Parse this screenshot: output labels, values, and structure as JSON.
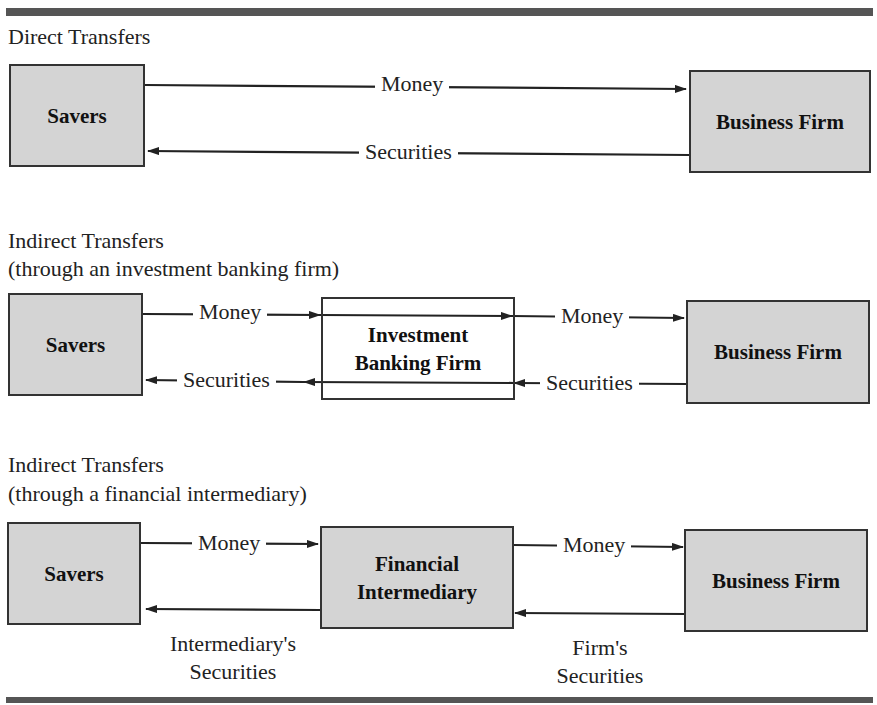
{
  "sections": [
    {
      "title": "Direct Transfers",
      "boxes": {
        "left": "Savers",
        "right": "Business Firm"
      },
      "flows": {
        "money": "Money",
        "securities": "Securities"
      }
    },
    {
      "title_line1": "Indirect Transfers",
      "title_line2": "(through an investment banking firm)",
      "boxes": {
        "left": "Savers",
        "middle_line1": "Investment",
        "middle_line2": "Banking Firm",
        "right": "Business Firm"
      },
      "flows": {
        "money_left": "Money",
        "money_right": "Money",
        "securities_left": "Securities",
        "securities_right": "Securities"
      }
    },
    {
      "title_line1": "Indirect Transfers",
      "title_line2": "(through a financial intermediary)",
      "boxes": {
        "left": "Savers",
        "middle_line1": "Financial",
        "middle_line2": "Intermediary",
        "right": "Business Firm"
      },
      "flows": {
        "money_left": "Money",
        "money_right": "Money",
        "securities_left_line1": "Intermediary's",
        "securities_left_line2": "Securities",
        "securities_right_line1": "Firm's",
        "securities_right_line2": "Securities"
      }
    }
  ],
  "colors": {
    "box_fill": "#d4d4d4",
    "box_border": "#333333",
    "rule": "#555555",
    "arrow": "#222222"
  }
}
